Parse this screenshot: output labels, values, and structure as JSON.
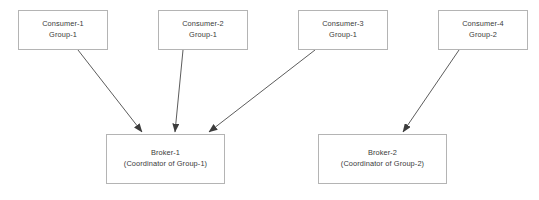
{
  "diagram": {
    "type": "flow-diagram",
    "canvas": {
      "width": 539,
      "height": 200,
      "background": "#ffffff"
    },
    "style": {
      "node_border_color": "#b4b4b4",
      "node_fill_color": "#ffffff",
      "text_color": "#3a3a3a",
      "edge_color": "#444444"
    },
    "consumers": [
      {
        "id": "consumer-1",
        "name": "Consumer-1",
        "group": "Group-1",
        "x": 18,
        "y": 10,
        "width": 90,
        "height": 40
      },
      {
        "id": "consumer-2",
        "name": "Consumer-2",
        "group": "Group-1",
        "x": 158,
        "y": 10,
        "width": 90,
        "height": 40
      },
      {
        "id": "consumer-3",
        "name": "Consumer-3",
        "group": "Group-1",
        "x": 298,
        "y": 10,
        "width": 90,
        "height": 40
      },
      {
        "id": "consumer-4",
        "name": "Consumer-4",
        "group": "Group-2",
        "x": 438,
        "y": 10,
        "width": 90,
        "height": 40
      }
    ],
    "brokers": [
      {
        "id": "broker-1",
        "name": "Broker-1",
        "role": "(Coordinator of Group-1)",
        "x": 106,
        "y": 134,
        "width": 119,
        "height": 50
      },
      {
        "id": "broker-2",
        "name": "Broker-2",
        "role": "(Coordinator of Group-2)",
        "x": 318,
        "y": 134,
        "width": 129,
        "height": 50
      }
    ],
    "edges": [
      {
        "id": "edge-consumer-1-broker-1",
        "from": "consumer-1",
        "to": "broker-1",
        "x1": 78,
        "y1": 50,
        "x2": 142,
        "y2": 132
      },
      {
        "id": "edge-consumer-2-broker-1",
        "from": "consumer-2",
        "to": "broker-1",
        "x1": 183,
        "y1": 50,
        "x2": 175,
        "y2": 132
      },
      {
        "id": "edge-consumer-3-broker-1",
        "from": "consumer-3",
        "to": "broker-1",
        "x1": 315,
        "y1": 50,
        "x2": 209,
        "y2": 132
      },
      {
        "id": "edge-consumer-4-broker-2",
        "from": "consumer-4",
        "to": "broker-2",
        "x1": 459,
        "y1": 50,
        "x2": 403,
        "y2": 132
      }
    ]
  }
}
